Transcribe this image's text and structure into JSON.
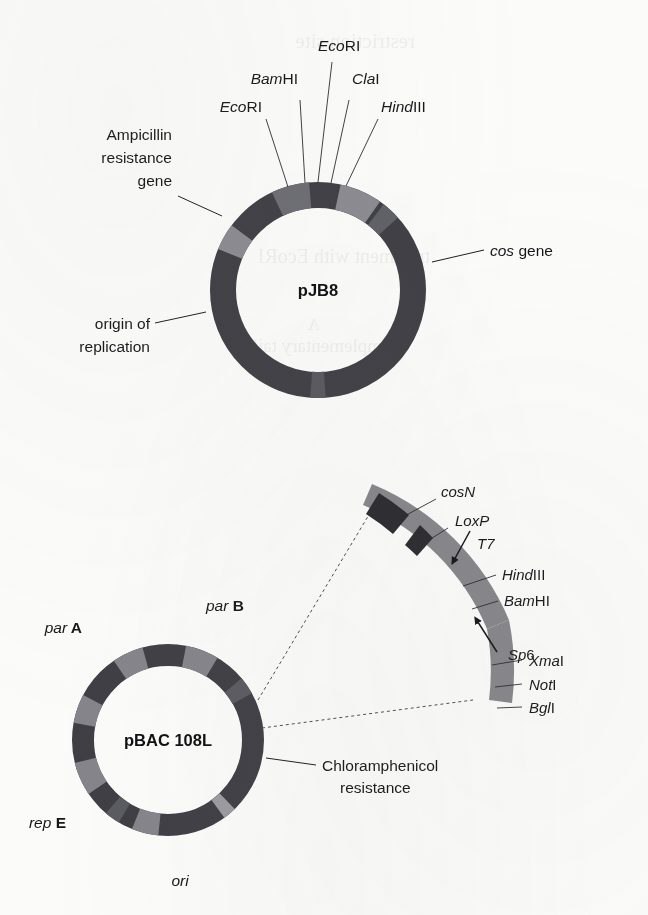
{
  "colors": {
    "paper": "#fbfbfa",
    "ring_dark": "#3e3e44",
    "ring_mid": "#6e6e74",
    "ring_light": "#8e8e93",
    "arc_body": "#858589",
    "arc_block_dark": "#2a2a2e",
    "ink": "#17171a",
    "leader": "#1d1d20",
    "dash": "#4a4a50"
  },
  "pjb8": {
    "name": "pJB8",
    "restriction_sites": [
      {
        "id": "site-ecori-left",
        "prefix": "Eco",
        "suffix": "RI",
        "full": "EcoRI"
      },
      {
        "id": "site-bamhi",
        "prefix": "Bam",
        "suffix": "HI",
        "full": "BamHI"
      },
      {
        "id": "site-ecori-top",
        "prefix": "Eco",
        "suffix": "RI",
        "full": "EcoRI"
      },
      {
        "id": "site-clai",
        "prefix": "Cla",
        "suffix": "I",
        "full": "ClaI"
      },
      {
        "id": "site-hindiii",
        "prefix": "Hind",
        "suffix": "III",
        "full": "HindIII"
      }
    ],
    "features": [
      {
        "id": "feature-ampicillin",
        "lines": [
          "Ampicillin",
          "resistance",
          "gene"
        ]
      },
      {
        "id": "feature-origin",
        "lines": [
          "origin of",
          "replication"
        ]
      },
      {
        "id": "feature-cos",
        "prefix": "cos",
        "suffix": " gene",
        "full": "cos gene"
      }
    ]
  },
  "pbac": {
    "name": "pBAC 108L",
    "features": [
      {
        "id": "feature-par-a",
        "prefix": "par",
        "suffix": " A",
        "full": "par A"
      },
      {
        "id": "feature-par-b",
        "prefix": "par",
        "suffix": " B",
        "full": "par B"
      },
      {
        "id": "feature-rep-e",
        "prefix": "rep",
        "suffix": " E",
        "full": "rep E"
      },
      {
        "id": "feature-ori",
        "prefix": "ori",
        "suffix": "",
        "full": "ori"
      }
    ],
    "resistance": {
      "id": "feature-chloramphenicol",
      "lines": [
        "Chloramphenicol",
        "resistance"
      ]
    }
  },
  "expanded_arc": {
    "elements": [
      {
        "id": "arc-cosn",
        "prefix": "cosN",
        "suffix": "",
        "full": "cosN",
        "kind": "site"
      },
      {
        "id": "arc-loxp",
        "prefix": "LoxP",
        "suffix": "",
        "full": "LoxP",
        "kind": "site"
      },
      {
        "id": "arc-t7",
        "prefix": "T7",
        "suffix": "",
        "full": "T7",
        "kind": "promoter"
      },
      {
        "id": "arc-hindiii",
        "prefix": "Hind",
        "suffix": "III",
        "full": "HindIII",
        "kind": "site"
      },
      {
        "id": "arc-bamhi",
        "prefix": "Bam",
        "suffix": "HI",
        "full": "BamHI",
        "kind": "site"
      },
      {
        "id": "arc-sp6",
        "prefix": "Sp",
        "suffix": "6",
        "full": "Sp6",
        "kind": "promoter"
      },
      {
        "id": "arc-xmai",
        "prefix": "Xma",
        "suffix": "I",
        "full": "XmaI",
        "kind": "site"
      },
      {
        "id": "arc-noti",
        "prefix": "Not",
        "suffix": "I",
        "full": "NotI",
        "kind": "site"
      },
      {
        "id": "arc-bgli",
        "prefix": "Bgl",
        "suffix": "I",
        "full": "BglI",
        "kind": "site"
      }
    ]
  },
  "ghost_text": {
    "lines": [
      "restriction site",
      "treatment with EcoRI",
      "A",
      "complementary tails"
    ]
  }
}
